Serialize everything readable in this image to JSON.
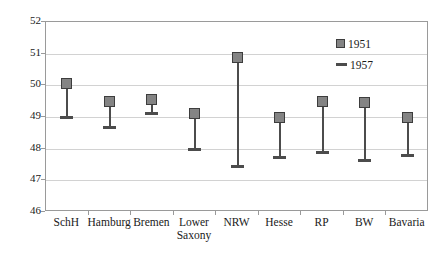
{
  "chart_data": {
    "type": "scatter",
    "title": "",
    "subtitle": "",
    "xlabel": "",
    "ylabel": "",
    "ylim": [
      46,
      52
    ],
    "y_ticks": [
      46,
      47,
      48,
      49,
      50,
      51,
      52
    ],
    "grid": true,
    "legend_position": "top-right",
    "categories": [
      "SchH",
      "Hamburg",
      "Bremen",
      "Lower\nSaxony",
      "NRW",
      "Hesse",
      "RP",
      "BW",
      "Bavaria"
    ],
    "series": [
      {
        "name": "1951",
        "marker": "square",
        "color": "#848484",
        "values": [
          50.05,
          49.5,
          49.55,
          49.1,
          50.87,
          49.0,
          49.5,
          49.45,
          48.97
        ]
      },
      {
        "name": "1957",
        "marker": "dash",
        "color": "#4c4c4c",
        "values": [
          49.0,
          48.67,
          49.1,
          47.98,
          47.43,
          47.73,
          47.88,
          47.64,
          47.79
        ]
      }
    ],
    "legend": [
      {
        "label": "1951",
        "marker": "square"
      },
      {
        "label": "1957",
        "marker": "dash"
      }
    ]
  },
  "colors": {
    "marker_fill": "#848484",
    "marker_border": "#3d3d3d",
    "connector": "#4c4c4c",
    "gridline": "#d2d2d2",
    "frame": "#9a9a9a",
    "background": "#ffffff",
    "text": "#1a1a1a"
  }
}
